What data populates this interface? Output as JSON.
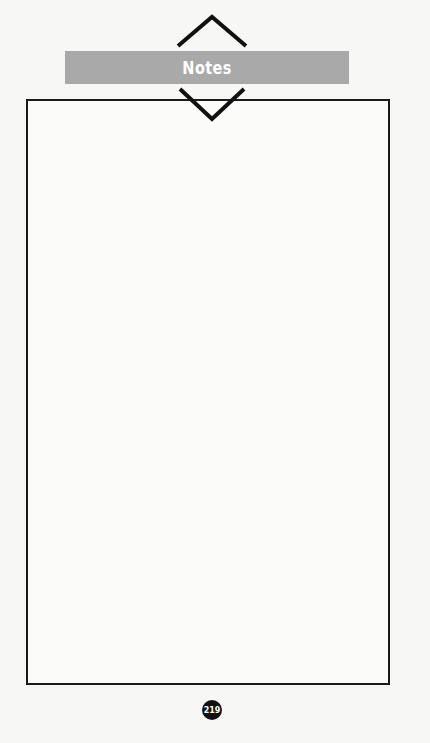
{
  "header": {
    "title": "Notes"
  },
  "notes_area": {
    "content": ""
  },
  "footer": {
    "page_number": "219"
  },
  "colors": {
    "banner": "#a9a9a9",
    "border": "#1a1a1a",
    "page_badge": "#111111"
  }
}
